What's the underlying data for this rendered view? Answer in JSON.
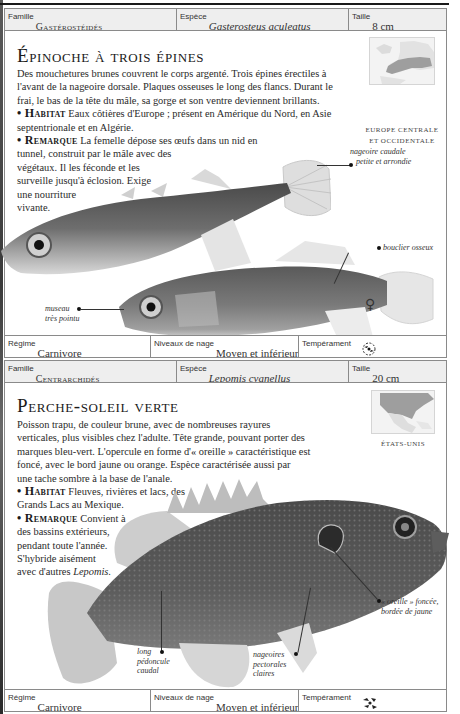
{
  "cards": [
    {
      "header": {
        "famille_label": "Famille",
        "famille_value": "Gastérostéidés",
        "espece_label": "Espèce",
        "espece_value": "Gasterosteus aculeatus",
        "taille_label": "Taille",
        "taille_value": "8 cm"
      },
      "title": "Épinoche à trois épines",
      "description": "Des mouchetures brunes couvrent le corps argenté. Trois épines érectiles à l'avant de la nageoire dorsale. Plaques osseuses le long des flancs. Durant le frai, le bas de la tête du mâle, sa gorge et son ventre deviennent brillants.",
      "habitat_label": "Habitat",
      "habitat_text": "Eaux côtières d'Europe ; présent en Amérique du Nord, en Asie septentrionale et en Algérie.",
      "remarque_label": "Remarque",
      "remarque_lines": [
        "La femelle dépose ses œufs dans un nid en",
        "tunnel, construit par le mâle avec des",
        "végétaux. Il les féconde et les",
        "surveille jusqu'à éclosion. Exige",
        "une nourriture",
        "vivante."
      ],
      "map": {
        "icon": "europe-map-icon",
        "caption_line1": "Europe centrale",
        "caption_line2": "et occidentale"
      },
      "annotations": {
        "caudal_line1": "nageoire caudale",
        "caudal_line2": "petite et arrondie",
        "bouclier": "bouclier osseux",
        "museau_line1": "museau",
        "museau_line2": "très pointu",
        "female_symbol": "♀"
      },
      "footer": {
        "regime_label": "Régime",
        "regime_value": "Carnivore",
        "nage_label": "Niveaux de nage",
        "nage_value": "Moyen et inférieur",
        "temperament_label": "Tempérament",
        "temperament_icon": "aggressive-fish-icon"
      }
    },
    {
      "header": {
        "famille_label": "Famille",
        "famille_value": "Centrarchidés",
        "espece_label": "Espèce",
        "espece_value": "Lepomis cyanellus",
        "taille_label": "Taille",
        "taille_value": "20 cm"
      },
      "title": "Perche-soleil verte",
      "description_lines": [
        "Poisson trapu, de couleur brune, avec de nombreuses rayures",
        "verticales, plus visibles chez l'adulte. Tête grande, pouvant porter des",
        "marques bleu-vert. L'opercule en forme d'« oreille » caractéristique est",
        "foncé, avec le bord jaune ou orange. Espèce caractérisée aussi par",
        "une tache sombre à la base de l'anale."
      ],
      "habitat_label": "Habitat",
      "habitat_line1": "Fleuves, rivières et lacs, des",
      "habitat_line2": "Grands Lacs au Mexique.",
      "remarque_label": "Remarque",
      "remarque_lines": [
        "Convient à",
        "des bassins extérieurs,",
        "pendant toute l'année.",
        "S'hybride aisément",
        "avec d'autres"
      ],
      "remarque_italic": "Lepomis",
      "remarque_end": ".",
      "map": {
        "icon": "north-america-map-icon",
        "caption_line1": "États-Unis"
      },
      "annotations": {
        "oreille_line1": "« oreille » foncée,",
        "oreille_line2": "bordée de jaune",
        "pedoncule_line1": "long",
        "pedoncule_line2": "pédoncule",
        "pedoncule_line3": "caudal",
        "pectorales_line1": "nageoires",
        "pectorales_line2": "pectorales",
        "pectorales_line3": "claires"
      },
      "footer": {
        "regime_label": "Régime",
        "regime_value": "Carnivore",
        "nage_label": "Niveaux de nage",
        "nage_value": "Moyen et inférieur",
        "temperament_label": "Tempérament",
        "temperament_icon": "aggressive-fish-icon"
      }
    }
  ]
}
